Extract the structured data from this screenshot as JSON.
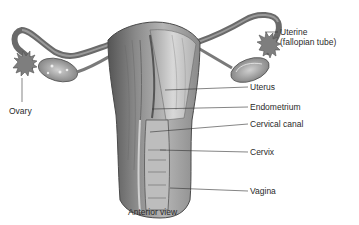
{
  "diagram": {
    "view_caption": "Anterior view",
    "labels": {
      "uterine_tube_line1": "Uterine",
      "uterine_tube_line2": "(fallopian tube)",
      "ovary": "Ovary",
      "uterus": "Uterus",
      "endometrium": "Endometrium",
      "cervical_canal": "Cervical canal",
      "cervix": "Cervix",
      "vagina": "Vagina"
    },
    "colors": {
      "background": "#ffffff",
      "tissue_dark": "#5a5a5a",
      "tissue_mid": "#8c8c8c",
      "tissue_light": "#c8c8c8",
      "leader_line": "#333333",
      "text": "#2a2a2a"
    }
  }
}
